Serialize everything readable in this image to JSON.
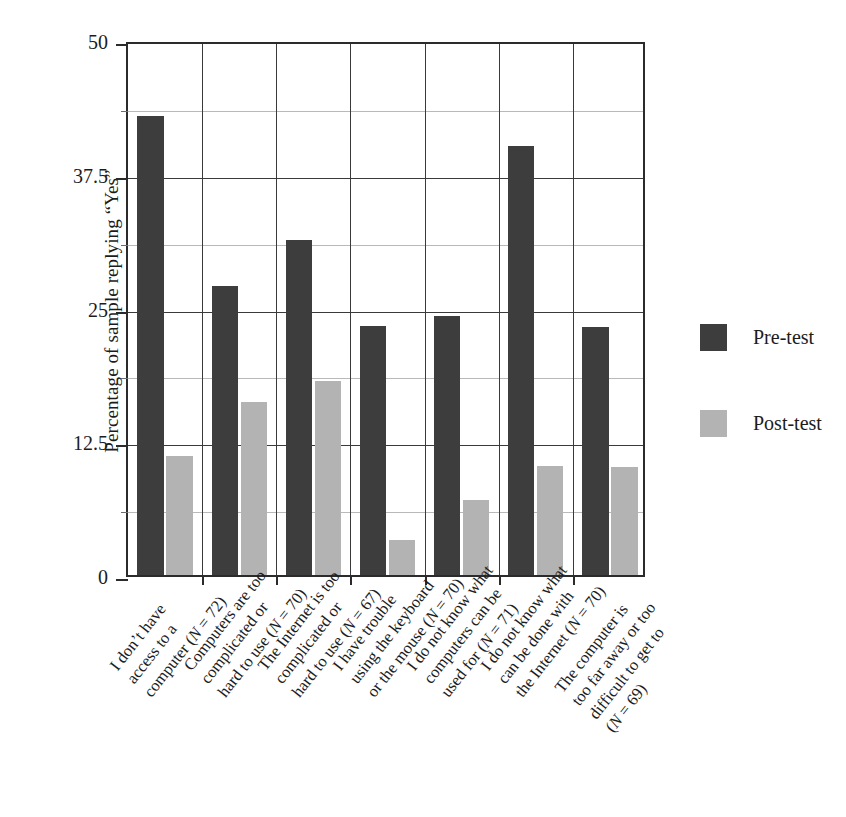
{
  "chart_data": {
    "type": "bar",
    "title": "",
    "xlabel": "",
    "ylabel": "Percentage of sample replying “Yes”",
    "ylim": [
      0,
      50
    ],
    "ytick_labels": [
      "0",
      "12.5",
      "25",
      "37.5",
      "50"
    ],
    "ytick_values": [
      0,
      12.5,
      25,
      37.5,
      50
    ],
    "yminor_values": [
      6.25,
      18.75,
      31.25,
      43.75
    ],
    "grid": "horizontal-and-vertical",
    "legend_position": "right",
    "categories": [
      "I don’t have access to a computer (N = 72)",
      "Computers are too complicated or hard to use (N = 70)",
      "The Internet is too complicated or hard to use (N = 67)",
      "I have trouble using the keyboard or the mouse (N = 70)",
      "I do not know what computers can be used for (N = 71)",
      "I do not know what can be done with the Internet (N = 70)",
      "The computer is too far away or too difficult to get to (N = 69)"
    ],
    "category_lines": [
      [
        "I don’t have",
        "access to a",
        "computer (N = 72)"
      ],
      [
        "Computers are too",
        "complicated or",
        "hard to use (N = 70)"
      ],
      [
        "The Internet is too",
        "complicated or",
        "hard to use (N = 67)"
      ],
      [
        "I have trouble",
        "using the keyboard",
        "or the mouse (N = 70)"
      ],
      [
        "I do not know what",
        "computers can be",
        "used for (N = 71)"
      ],
      [
        "I do not know what",
        "can be done with",
        "the Internet (N = 70)"
      ],
      [
        "The computer is",
        "too far away or too",
        "difficult to get to",
        "(N = 69)"
      ]
    ],
    "series": [
      {
        "name": "Pre-test",
        "color": "#3d3d3d",
        "values": [
          42.9,
          27.0,
          31.3,
          23.3,
          24.2,
          40.1,
          23.2
        ]
      },
      {
        "name": "Post-test",
        "color": "#b3b3b3",
        "values": [
          11.1,
          16.2,
          18.1,
          3.3,
          7.0,
          10.2,
          10.1
        ]
      }
    ]
  },
  "legend": {
    "items": [
      {
        "label": "Pre-test",
        "color": "#3d3d3d"
      },
      {
        "label": "Post-test",
        "color": "#b3b3b3"
      }
    ]
  },
  "axes": {
    "y_axis_title": "Percentage of sample replying “Yes”"
  }
}
